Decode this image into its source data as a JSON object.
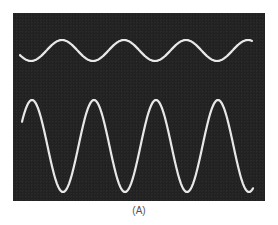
{
  "figure": {
    "caption": "(A)",
    "panel_color": "#212121",
    "trace_color": "#e8e8e8"
  },
  "chart_data": {
    "type": "line",
    "title": "",
    "xlabel": "",
    "ylabel": "",
    "grid": false,
    "legend": "none",
    "caption": "(A)",
    "series": [
      {
        "name": "upper trace (small amplitude sine)",
        "shape": "sine",
        "amplitude_px": 10.5,
        "center_y_px": 50.5,
        "period_px": 62,
        "peaks_x_px": [
          62,
          124,
          187,
          250
        ],
        "troughs_x_px": [
          35,
          97,
          158,
          220
        ],
        "x_range_px": [
          20,
          252
        ]
      },
      {
        "name": "lower trace (large amplitude, clipped troughs)",
        "shape": "sine with flattened troughs",
        "amplitude_px": 46,
        "center_y_px": 146,
        "period_px": 62,
        "peaks_x_px": [
          32,
          94,
          155,
          217
        ],
        "troughs_x_px": [
          62,
          124,
          187,
          249
        ],
        "clip_level_y_px": 192,
        "x_range_px": [
          22,
          253
        ]
      }
    ]
  }
}
